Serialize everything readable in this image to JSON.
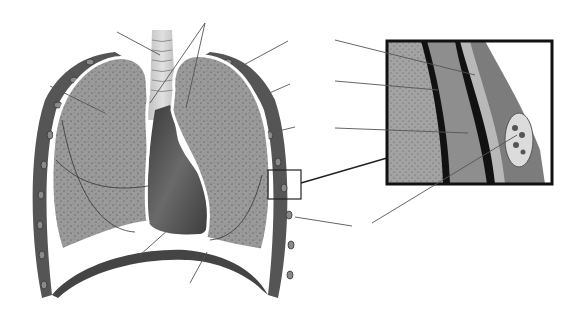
{
  "diagram": {
    "background": "#ffffff",
    "colors": {
      "lung_tissue": "#9a9a9a",
      "lung_speckle": "#3a3a3a",
      "pleura_line": "#ffffff",
      "rib_wall": "#555555",
      "rib_bone": "#8a8a8a",
      "heart": "#4e4e4e",
      "trachea": "#cfcfcf",
      "leader_line": "#555555",
      "inset_border": "#111111",
      "pleural_cavity": "#8e8e8e",
      "muscle": "#7c7c7c"
    },
    "leader_lines": [
      {
        "id": "trachea",
        "x1": 117,
        "y1": 32,
        "x2": 160,
        "y2": 55
      },
      {
        "id": "bronchi-a",
        "x1": 205,
        "y1": 23,
        "x2": 150,
        "y2": 103
      },
      {
        "id": "bronchi-b",
        "x1": 205,
        "y1": 23,
        "x2": 186,
        "y2": 108
      },
      {
        "id": "right-lung",
        "x1": 50,
        "y1": 86,
        "x2": 105,
        "y2": 113
      },
      {
        "id": "rib-upper",
        "x1": 288,
        "y1": 41,
        "x2": 238,
        "y2": 68
      },
      {
        "id": "rib-mid",
        "x1": 290,
        "y1": 84,
        "x2": 258,
        "y2": 98
      },
      {
        "id": "rib-lower",
        "x1": 295,
        "y1": 127,
        "x2": 270,
        "y2": 133
      },
      {
        "id": "intercostal",
        "x1": 352,
        "y1": 226,
        "x2": 295,
        "y2": 217
      },
      {
        "id": "heart",
        "x1": 140,
        "y1": 255,
        "x2": 168,
        "y2": 230
      },
      {
        "id": "diaphragm",
        "x1": 190,
        "y1": 283,
        "x2": 207,
        "y2": 252
      },
      {
        "id": "inset-parietal",
        "x1": 335,
        "y1": 40,
        "x2": 475,
        "y2": 75
      },
      {
        "id": "inset-visceral",
        "x1": 335,
        "y1": 81,
        "x2": 438,
        "y2": 90
      },
      {
        "id": "inset-cavity",
        "x1": 335,
        "y1": 128,
        "x2": 468,
        "y2": 133
      },
      {
        "id": "inset-nerve",
        "x1": 372,
        "y1": 223,
        "x2": 517,
        "y2": 135
      }
    ],
    "inset": {
      "x": 387,
      "y": 41,
      "width": 165,
      "height": 143
    },
    "zoom_box": {
      "x": 268,
      "y": 170,
      "width": 33,
      "height": 29
    },
    "labels": []
  }
}
